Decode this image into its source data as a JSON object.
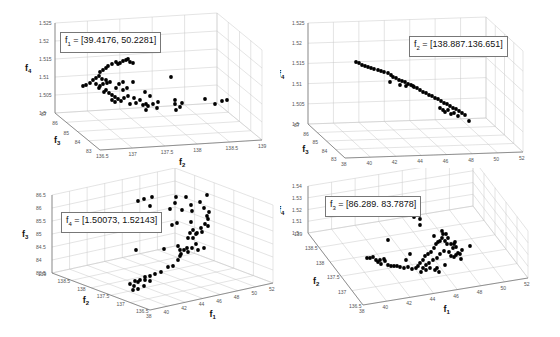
{
  "chart_data": [
    {
      "type": "scatter",
      "subtitle": "3D scatter",
      "annotation": {
        "var": "f",
        "sub": "1",
        "text": " = [39.4176, 50.2281]"
      },
      "axes": {
        "x": {
          "label": "f2",
          "ticks": [
            "136.5",
            "137",
            "137.5",
            "138",
            "138.5",
            "139"
          ],
          "range": [
            136.5,
            139
          ]
        },
        "y": {
          "label": "f3",
          "ticks": [
            "83",
            "84",
            "85",
            "86",
            "87"
          ],
          "range": [
            83,
            87
          ]
        },
        "z": {
          "label": "f4",
          "ticks": [
            "1.5",
            "1.505",
            "1.51",
            "1.515",
            "1.52",
            "1.525"
          ],
          "range": [
            1.5,
            1.525
          ]
        }
      },
      "grid": true,
      "points_screen": [
        [
          83,
          86
        ],
        [
          86,
          85
        ],
        [
          90,
          83
        ],
        [
          93,
          80
        ],
        [
          96,
          78
        ],
        [
          99,
          76
        ],
        [
          100,
          72
        ],
        [
          103,
          70
        ],
        [
          106,
          68
        ],
        [
          108,
          66
        ],
        [
          112,
          64
        ],
        [
          116,
          62
        ],
        [
          118,
          64
        ],
        [
          120,
          63
        ],
        [
          123,
          61
        ],
        [
          126,
          60
        ],
        [
          128,
          59
        ],
        [
          130,
          62
        ],
        [
          133,
          63
        ],
        [
          96,
          84
        ],
        [
          100,
          86
        ],
        [
          103,
          84
        ],
        [
          107,
          83
        ],
        [
          110,
          82
        ],
        [
          106,
          90
        ],
        [
          109,
          93
        ],
        [
          112,
          95
        ],
        [
          115,
          97
        ],
        [
          118,
          99
        ],
        [
          121,
          101
        ],
        [
          124,
          98
        ],
        [
          128,
          96
        ],
        [
          116,
          88
        ],
        [
          119,
          84
        ],
        [
          123,
          82
        ],
        [
          106,
          80
        ],
        [
          102,
          79
        ],
        [
          99,
          88
        ],
        [
          104,
          92
        ],
        [
          112,
          100
        ],
        [
          115,
          102
        ],
        [
          130,
          104
        ],
        [
          134,
          98
        ],
        [
          136,
          103
        ],
        [
          140,
          100
        ],
        [
          143,
          105
        ],
        [
          146,
          104
        ],
        [
          146,
          110
        ],
        [
          148,
          106
        ],
        [
          153,
          104
        ],
        [
          158,
          102
        ],
        [
          157,
          108
        ],
        [
          175,
          104
        ],
        [
          176,
          110
        ],
        [
          175,
          100
        ],
        [
          180,
          107
        ],
        [
          182,
          103
        ],
        [
          171,
          77
        ],
        [
          133,
          82
        ],
        [
          205,
          99
        ],
        [
          215,
          104
        ],
        [
          222,
          101
        ],
        [
          227,
          100
        ],
        [
          145,
          92
        ],
        [
          150,
          96
        ],
        [
          123,
          90
        ],
        [
          127,
          88
        ]
      ]
    },
    {
      "type": "scatter",
      "annotation": {
        "var": "f",
        "sub": "2",
        "text": " = [138.887.136.651]"
      },
      "axes": {
        "x": {
          "label": "f1",
          "ticks": [
            "38",
            "40",
            "42",
            "44",
            "46",
            "48",
            "50",
            "52"
          ],
          "range": [
            38,
            52
          ]
        },
        "y": {
          "label": "f3",
          "ticks": [
            "83",
            "84",
            "85",
            "86",
            "87"
          ],
          "range": [
            83,
            87
          ]
        },
        "z": {
          "label": "f4",
          "ticks": [
            "1.5",
            "1.505",
            "1.51",
            "1.515",
            "1.52",
            "1.525"
          ],
          "range": [
            1.5,
            1.525
          ]
        }
      },
      "grid": true,
      "points_screen": [
        [
          76,
          62
        ],
        [
          79,
          63
        ],
        [
          82,
          65
        ],
        [
          85,
          66
        ],
        [
          88,
          67
        ],
        [
          91,
          68
        ],
        [
          94,
          69
        ],
        [
          98,
          70
        ],
        [
          101,
          71
        ],
        [
          104,
          72
        ],
        [
          108,
          73
        ],
        [
          111,
          75
        ],
        [
          113,
          77
        ],
        [
          116,
          78
        ],
        [
          119,
          80
        ],
        [
          122,
          81
        ],
        [
          125,
          82
        ],
        [
          128,
          84
        ],
        [
          131,
          85
        ],
        [
          134,
          87
        ],
        [
          137,
          88
        ],
        [
          140,
          90
        ],
        [
          143,
          92
        ],
        [
          146,
          93
        ],
        [
          149,
          95
        ],
        [
          152,
          96
        ],
        [
          155,
          98
        ],
        [
          158,
          99
        ],
        [
          161,
          101
        ],
        [
          164,
          103
        ],
        [
          167,
          104
        ],
        [
          170,
          106
        ],
        [
          173,
          108
        ],
        [
          176,
          109
        ],
        [
          179,
          111
        ],
        [
          182,
          113
        ],
        [
          185,
          115
        ],
        [
          189,
          121
        ],
        [
          110,
          82
        ],
        [
          120,
          85
        ],
        [
          126,
          86
        ],
        [
          133,
          86
        ],
        [
          160,
          108
        ],
        [
          163,
          110
        ],
        [
          165,
          112
        ],
        [
          168,
          110
        ],
        [
          171,
          114
        ],
        [
          174,
          113
        ],
        [
          178,
          116
        ]
      ]
    },
    {
      "type": "scatter",
      "annotation": {
        "var": "f",
        "sub": "4",
        "text": "  = [1.50073, 1.52143]"
      },
      "axes": {
        "x": {
          "label": "f1",
          "ticks": [
            "38",
            "40",
            "42",
            "44",
            "46",
            "48",
            "50",
            "52"
          ],
          "range": [
            38,
            52
          ]
        },
        "y": {
          "label": "f2",
          "ticks": [
            "136.5",
            "137",
            "137.5",
            "138",
            "138.5",
            "139"
          ],
          "range": [
            136.5,
            139
          ]
        },
        "z": {
          "label": "f3",
          "ticks": [
            "83.5",
            "84",
            "84.5",
            "85",
            "85.5",
            "86",
            "86.5"
          ],
          "range": [
            83.5,
            86.5
          ]
        }
      },
      "grid": true,
      "points_screen": [
        [
          138,
          33
        ],
        [
          144,
          31
        ],
        [
          152,
          29
        ],
        [
          150,
          38
        ],
        [
          176,
          29
        ],
        [
          186,
          29
        ],
        [
          207,
          27
        ],
        [
          175,
          35
        ],
        [
          170,
          41
        ],
        [
          182,
          42
        ],
        [
          191,
          37
        ],
        [
          192,
          43
        ],
        [
          200,
          34
        ],
        [
          204,
          40
        ],
        [
          209,
          44
        ],
        [
          208,
          51
        ],
        [
          205,
          56
        ],
        [
          201,
          60
        ],
        [
          197,
          65
        ],
        [
          190,
          65
        ],
        [
          193,
          70
        ],
        [
          196,
          66
        ],
        [
          208,
          58
        ],
        [
          207,
          48
        ],
        [
          191,
          54
        ],
        [
          193,
          62
        ],
        [
          188,
          70
        ],
        [
          184,
          82
        ],
        [
          188,
          84
        ],
        [
          192,
          80
        ],
        [
          198,
          82
        ],
        [
          204,
          80
        ],
        [
          187,
          80
        ],
        [
          180,
          82
        ],
        [
          178,
          78
        ],
        [
          181,
          86
        ],
        [
          164,
          81
        ],
        [
          177,
          55
        ],
        [
          172,
          57
        ],
        [
          136,
          82
        ],
        [
          178,
          92
        ],
        [
          173,
          98
        ],
        [
          168,
          99
        ],
        [
          161,
          104
        ],
        [
          155,
          106
        ],
        [
          150,
          108
        ],
        [
          145,
          109
        ],
        [
          140,
          112
        ],
        [
          135,
          113
        ],
        [
          130,
          116
        ],
        [
          138,
          114
        ],
        [
          144,
          118
        ],
        [
          145,
          112
        ],
        [
          150,
          113
        ],
        [
          138,
          121
        ],
        [
          134,
          118
        ],
        [
          133,
          122
        ],
        [
          180,
          88
        ],
        [
          196,
          76
        ],
        [
          202,
          64
        ]
      ]
    },
    {
      "type": "scatter",
      "annotation": {
        "var": "f",
        "sub": "3",
        "text": " = [86.289. 83.7878]"
      },
      "axes": {
        "x": {
          "label": "f1",
          "ticks": [
            "38",
            "40",
            "42",
            "44",
            "46",
            "48",
            "50",
            "52"
          ],
          "range": [
            38,
            52
          ]
        },
        "y": {
          "label": "f2",
          "ticks": [
            "136.5",
            "137",
            "137.5",
            "138",
            "138.5",
            "139"
          ],
          "range": [
            136.5,
            139
          ]
        },
        "z": {
          "label": "f4",
          "ticks": [
            "1.5",
            "1.51",
            "1.52",
            "1.53",
            "1.54"
          ],
          "range": [
            1.5,
            1.54
          ]
        }
      },
      "grid": true,
      "points_screen": [
        [
          87,
          90
        ],
        [
          90,
          90
        ],
        [
          93,
          89
        ],
        [
          96,
          92
        ],
        [
          98,
          94
        ],
        [
          100,
          92
        ],
        [
          105,
          93
        ],
        [
          108,
          97
        ],
        [
          111,
          98
        ],
        [
          114,
          98
        ],
        [
          117,
          98
        ],
        [
          120,
          99
        ],
        [
          124,
          100
        ],
        [
          128,
          99
        ],
        [
          132,
          101
        ],
        [
          136,
          100
        ],
        [
          138,
          98
        ],
        [
          140,
          95
        ],
        [
          143,
          92
        ],
        [
          145,
          88
        ],
        [
          148,
          86
        ],
        [
          151,
          84
        ],
        [
          154,
          80
        ],
        [
          156,
          76
        ],
        [
          158,
          74
        ],
        [
          160,
          73
        ],
        [
          162,
          70
        ],
        [
          163,
          66
        ],
        [
          165,
          73
        ],
        [
          167,
          76
        ],
        [
          169,
          84
        ],
        [
          171,
          88
        ],
        [
          174,
          89
        ],
        [
          176,
          87
        ],
        [
          178,
          85
        ],
        [
          180,
          86
        ],
        [
          182,
          82
        ],
        [
          173,
          80
        ],
        [
          171,
          76
        ],
        [
          175,
          74
        ],
        [
          168,
          70
        ],
        [
          164,
          83
        ],
        [
          160,
          86
        ],
        [
          157,
          90
        ],
        [
          153,
          92
        ],
        [
          149,
          95
        ],
        [
          146,
          97
        ],
        [
          150,
          100
        ],
        [
          155,
          102
        ],
        [
          159,
          104
        ],
        [
          143,
          100
        ],
        [
          141,
          104
        ],
        [
          146,
          102
        ],
        [
          134,
          49
        ],
        [
          140,
          51
        ],
        [
          140,
          57
        ],
        [
          108,
          72
        ],
        [
          154,
          68
        ],
        [
          162,
          63
        ],
        [
          166,
          66
        ],
        [
          174,
          76
        ],
        [
          176,
          79
        ],
        [
          190,
          78
        ],
        [
          130,
          86
        ],
        [
          126,
          92
        ],
        [
          104,
          91
        ],
        [
          101,
          96
        ],
        [
          157,
          100
        ],
        [
          165,
          97
        ],
        [
          181,
          91
        ]
      ]
    }
  ]
}
